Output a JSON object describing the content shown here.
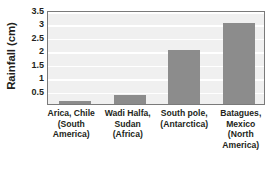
{
  "chart_data": {
    "type": "bar",
    "title": "",
    "xlabel": "",
    "ylabel": "Rainfall (cm)",
    "ylim": [
      0,
      3.5
    ],
    "ytick_values": [
      3.5,
      3,
      2.5,
      2,
      1.5,
      1,
      0.5
    ],
    "ytick_labels": [
      "3.5",
      "3",
      "2.5",
      "2",
      "1.5",
      "1",
      "0.5"
    ],
    "grid": true,
    "legend": "none",
    "bar_color": "#8c8c8c",
    "plot_background": "#f0f0f0",
    "gridline_color": "#ffffff",
    "frame_color": "#7a7a7a",
    "categories": [
      "Arica, Chile (South America)",
      "Wadi Halfa, Sudan (Africa)",
      "South pole, (Antarctica)",
      "Batagues, Mexico (North America)"
    ],
    "values": [
      0.1,
      0.35,
      2.0,
      3.0
    ],
    "category_lines": [
      [
        "Arica, Chile",
        "(South",
        "America)"
      ],
      [
        "Wadi Halfa,",
        "Sudan",
        "(Africa)"
      ],
      [
        "South pole,",
        "(Antarctica)"
      ],
      [
        "Batagues,",
        "Mexico",
        "(North",
        "America)"
      ]
    ]
  }
}
